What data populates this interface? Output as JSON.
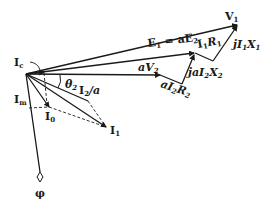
{
  "diagram": {
    "type": "transformer-phasor-diagram",
    "colors": {
      "ink": "#1a1a1a",
      "background": "#ffffff"
    },
    "phasors": [
      {
        "id": "V1",
        "label": "V",
        "sub": "1"
      },
      {
        "id": "E1",
        "label": "E",
        "sub": "1",
        "suffix": " = aE",
        "suffix_sub": "2"
      },
      {
        "id": "I1R1",
        "label": "I",
        "sub": "1",
        "suffix": "R",
        "suffix_sub": "1"
      },
      {
        "id": "jI1X1",
        "label": "jI",
        "sub": "1",
        "suffix": "X",
        "suffix_sub": "1"
      },
      {
        "id": "aV2",
        "label": "aV",
        "sub": "2"
      },
      {
        "id": "aI2R2",
        "label": "aI",
        "sub": "2",
        "suffix": "R",
        "suffix_sub": "2"
      },
      {
        "id": "jaI2X2",
        "label": "jaI",
        "sub": "2",
        "suffix": "X",
        "suffix_sub": "2"
      },
      {
        "id": "theta2",
        "label": "θ",
        "sub": "2"
      },
      {
        "id": "I2a",
        "label": "I",
        "sub": "2",
        "suffix": "/a"
      },
      {
        "id": "I1",
        "label": "I",
        "sub": "1"
      },
      {
        "id": "I0",
        "label": "I",
        "sub": "0"
      },
      {
        "id": "Ic",
        "label": "I",
        "sub": "c"
      },
      {
        "id": "Im",
        "label": "I",
        "sub": "m"
      },
      {
        "id": "phi",
        "label": "φ"
      }
    ]
  }
}
